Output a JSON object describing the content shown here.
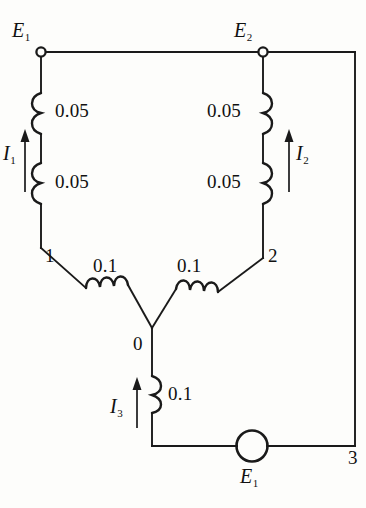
{
  "figure": {
    "type": "electrical-circuit-schematic",
    "background_color": "#fdfdfb",
    "line_color": "#1a1a1a"
  },
  "sources": {
    "e1_top": "E",
    "e1_top_sub": "1",
    "e2_top": "E",
    "e2_top_sub": "2",
    "e1_bottom": "E",
    "e1_bottom_sub": "1"
  },
  "currents": {
    "i1": "I",
    "i1_sub": "1",
    "i2": "I",
    "i2_sub": "2",
    "i3": "I",
    "i3_sub": "3"
  },
  "nodes": {
    "n1": "1",
    "n2": "2",
    "n0": "0",
    "n3": "3"
  },
  "impedances": {
    "left_upper": "0.05",
    "left_lower": "0.05",
    "right_upper": "0.05",
    "right_lower": "0.05",
    "branch_left": "0.1",
    "branch_right": "0.1",
    "branch_bottom": "0.1"
  },
  "elements": {
    "terminal_e1_label": "terminal-node-e1",
    "terminal_e2_label": "terminal-node-e2",
    "source_symbol_label": "voltage-source-circle"
  }
}
